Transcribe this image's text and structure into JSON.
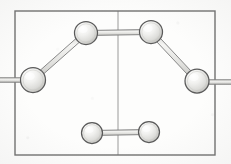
{
  "figure": {
    "caption": "",
    "background_color": "#fdfdfc",
    "ink_color": "#6b6b6b",
    "sphere_fill": "#e8e8e6",
    "sphere_outline": "#5a5a5a",
    "bond_outline": "#7a7a7a",
    "bond_fill": "#dcdcda",
    "frame": {
      "name": "unit-cell-frame",
      "x": 15,
      "y": 11,
      "width": 200,
      "height": 144,
      "stroke": "#707070",
      "stroke_width": 1.4
    },
    "guide_lines": [
      {
        "name": "vertical-center-line",
        "x1": 118,
        "y1": 11,
        "x2": 118,
        "y2": 155,
        "stroke": "#8e8e8e",
        "stroke_width": 0.9
      },
      {
        "name": "horizontal-mid-line-left",
        "x1": 0,
        "y1": 80,
        "x2": 33,
        "y2": 80,
        "stroke": "#8e8e8e",
        "stroke_width": 1.2
      },
      {
        "name": "horizontal-mid-line-right",
        "x1": 197,
        "y1": 82,
        "x2": 231,
        "y2": 82,
        "stroke": "#8e8e8e",
        "stroke_width": 1.2
      }
    ],
    "atoms": [
      {
        "id": "a1",
        "label": "atom-left",
        "cx": 33,
        "cy": 80,
        "r": 12.5
      },
      {
        "id": "a2",
        "label": "atom-top-left",
        "cx": 86,
        "cy": 33,
        "r": 11.5
      },
      {
        "id": "a3",
        "label": "atom-top-right",
        "cx": 151,
        "cy": 32,
        "r": 11.5
      },
      {
        "id": "a4",
        "label": "atom-right",
        "cx": 197,
        "cy": 81,
        "r": 12.0
      },
      {
        "id": "a5",
        "label": "atom-bottom-left",
        "cx": 92,
        "cy": 133,
        "r": 10.5
      },
      {
        "id": "a6",
        "label": "atom-bottom-right",
        "cx": 149,
        "cy": 132,
        "r": 10.5
      }
    ],
    "bonds": [
      {
        "id": "b1",
        "label": "bond-left-to-topleft",
        "from": "a1",
        "to": "a2",
        "width": 5.0
      },
      {
        "id": "b2",
        "label": "bond-topleft-to-topright",
        "from": "a2",
        "to": "a3",
        "width": 5.0
      },
      {
        "id": "b3",
        "label": "bond-topright-to-right",
        "from": "a3",
        "to": "a4",
        "width": 5.0
      },
      {
        "id": "b4",
        "label": "bond-bottomleft-to-bottomright",
        "from": "a5",
        "to": "a6",
        "width": 5.0
      }
    ],
    "bond_stubs": [
      {
        "id": "s1",
        "label": "bond-stub-left-edge",
        "x1": 0,
        "y1": 80,
        "x2": 22,
        "y2": 80,
        "width": 4.5
      },
      {
        "id": "s2",
        "label": "bond-stub-right-edge",
        "x1": 208,
        "y1": 82,
        "x2": 231,
        "y2": 82,
        "width": 4.5
      }
    ],
    "counts": {
      "atoms": 6,
      "bonds": 4
    }
  }
}
